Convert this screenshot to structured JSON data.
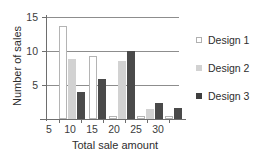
{
  "chart_data": {
    "type": "bar",
    "title": "",
    "xlabel": "Total sale amount",
    "ylabel": "Number of sales",
    "categories": [
      "5",
      "10",
      "15",
      "20",
      "25",
      "30"
    ],
    "ylim": [
      0,
      15
    ],
    "yticks": [
      5,
      10,
      15
    ],
    "ytick_labels": [
      "5",
      "10",
      "15"
    ],
    "grid": true,
    "legend_position": "right",
    "series": [
      {
        "name": "Design 1",
        "color": "#ffffff",
        "values": [
          0,
          13.7,
          9.3,
          0.4,
          0.4,
          0.4
        ]
      },
      {
        "name": "Design 2",
        "color": "#d2d2d2",
        "values": [
          0,
          8.8,
          0,
          8.5,
          1.4,
          0
        ]
      },
      {
        "name": "Design 3",
        "color": "#4a4a4a",
        "values": [
          0,
          4.0,
          5.9,
          10.0,
          2.3,
          1.6
        ]
      }
    ]
  },
  "axes": {
    "y_labels": {
      "v15": "15",
      "v10": "10",
      "v5": "5"
    },
    "x_labels": {
      "v5": "5",
      "v10": "10",
      "v15": "15",
      "v20": "20",
      "v25": "25",
      "v30": "30"
    },
    "x_title": "Total sale amount",
    "y_title": "Number of sales"
  },
  "legend": {
    "items": [
      {
        "label": "Design 1"
      },
      {
        "label": "Design 2"
      },
      {
        "label": "Design 3"
      }
    ]
  }
}
